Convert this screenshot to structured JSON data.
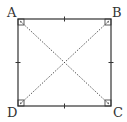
{
  "diagram": {
    "type": "square",
    "vertices": [
      {
        "label": "A",
        "x": 18,
        "y": 19
      },
      {
        "label": "B",
        "x": 111,
        "y": 19
      },
      {
        "label": "C",
        "x": 111,
        "y": 106
      },
      {
        "label": "D",
        "x": 18,
        "y": 106
      }
    ],
    "sides": [
      "AB",
      "BC",
      "CD",
      "DA"
    ],
    "diagonals": [
      "AC",
      "BD"
    ],
    "diagonal_style": "dotted",
    "right_angle_marks": [
      "A",
      "B",
      "C",
      "D"
    ],
    "equal_side_ticks": 1,
    "colors": {
      "stroke": "#333333",
      "background": "#ffffff"
    }
  }
}
